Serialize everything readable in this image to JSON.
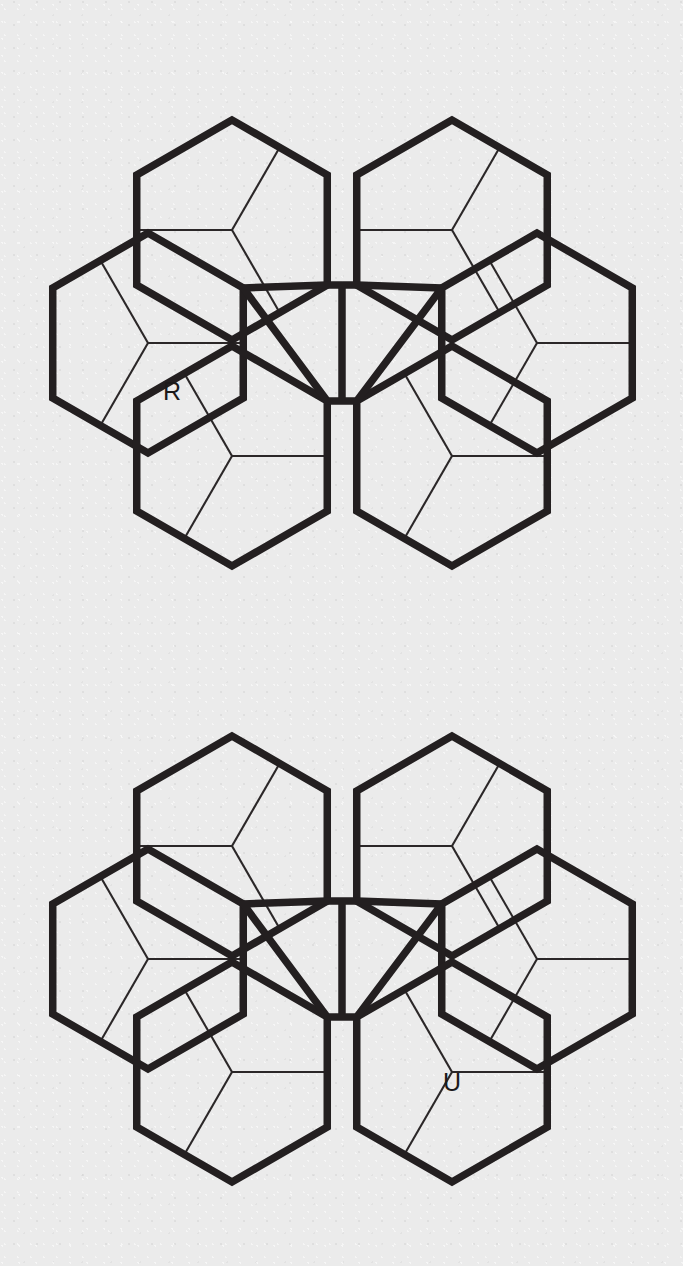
{
  "page": {
    "background_color": "#ebebeb",
    "line_color": "#231f20",
    "width": 683,
    "height": 1266,
    "figure_count": 2
  },
  "figures": [
    {
      "id": "figure-top",
      "label": "R",
      "label_position": "left-hexagon-lower-pentagon",
      "label_x": 172,
      "label_y": 393
    },
    {
      "id": "figure-bottom",
      "label": "U",
      "label_position": "lower-right-hexagon-upper-pentagon",
      "label_x": 452,
      "label_y": 468
    }
  ],
  "geometry": {
    "type": "hexagon-pentagon-tiling",
    "description": "Six hexagons arranged in a flower around a central rosette; each hexagon subdivided into three pentagons",
    "hexagon_count": 6,
    "pentagons_per_hexagon": 3,
    "outline_stroke_width": 7.5,
    "subdivision_stroke_width": 2.1,
    "hex_radius": 110,
    "centers": [
      {
        "name": "top-left",
        "x": 232,
        "y": 230
      },
      {
        "name": "top-right",
        "x": 452,
        "y": 230
      },
      {
        "name": "left",
        "x": 148,
        "y": 343
      },
      {
        "name": "right",
        "x": 537,
        "y": 343
      },
      {
        "name": "bottom-left",
        "x": 232,
        "y": 456
      },
      {
        "name": "bottom-right",
        "x": 452,
        "y": 456
      }
    ],
    "bounds": {
      "left": 45,
      "right": 640,
      "top": 70,
      "bottom": 612
    },
    "center_x": 342,
    "center_y": 343
  }
}
